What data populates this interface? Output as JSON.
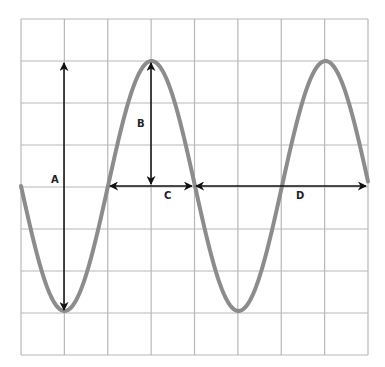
{
  "diagram": {
    "grid": {
      "columns": 8,
      "rows": 8,
      "left": 21,
      "top": 19,
      "right": 368,
      "bottom": 355,
      "color": "#b8b8b8"
    },
    "wave": {
      "color": "#8c8c8c",
      "midline_y": 186,
      "amplitude_px": 125,
      "period_px": 174,
      "start_x": 21,
      "end_x": 368,
      "phase": "starts at midline going down"
    },
    "arrow_color": "#111111",
    "labels": [
      {
        "id": "A",
        "text": "A",
        "meaning": "peak-to-peak amplitude"
      },
      {
        "id": "B",
        "text": "B",
        "meaning": "amplitude (midline to peak)"
      },
      {
        "id": "C",
        "text": "C",
        "meaning": "half wavelength"
      },
      {
        "id": "D",
        "text": "D",
        "meaning": "full wavelength"
      }
    ]
  }
}
